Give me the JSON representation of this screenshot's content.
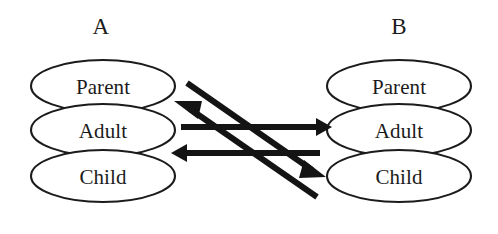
{
  "figure": {
    "background_color": "#ffffff",
    "ink_color": "#1b1b1b",
    "arrow_color": "#141414"
  },
  "columns": [
    {
      "key": "a",
      "label": "A",
      "label_x": 101,
      "label_y": 34,
      "center_x": 103,
      "states": [
        {
          "key": "parent",
          "label": "Parent",
          "cx": 103,
          "cy": 86,
          "rx": 72,
          "ry": 26,
          "text_y": 94
        },
        {
          "key": "adult",
          "label": "Adult",
          "cx": 103,
          "cy": 130,
          "rx": 72,
          "ry": 26,
          "text_y": 138
        },
        {
          "key": "child",
          "label": "Child",
          "cx": 103,
          "cy": 176,
          "rx": 72,
          "ry": 26,
          "text_y": 184
        }
      ]
    },
    {
      "key": "b",
      "label": "B",
      "label_x": 399,
      "label_y": 34,
      "center_x": 399,
      "states": [
        {
          "key": "parent",
          "label": "Parent",
          "cx": 399,
          "cy": 86,
          "rx": 72,
          "ry": 26,
          "text_y": 94
        },
        {
          "key": "adult",
          "label": "Adult",
          "cx": 399,
          "cy": 130,
          "rx": 72,
          "ry": 26,
          "text_y": 138
        },
        {
          "key": "child",
          "label": "Child",
          "cx": 399,
          "cy": 176,
          "rx": 72,
          "ry": 26,
          "text_y": 184
        }
      ]
    }
  ],
  "arrows": [
    {
      "key": "a-adult-to-b-adult",
      "from": "A Adult",
      "to": "B Adult",
      "kind": "horizontal",
      "direction": "right",
      "x1": 181,
      "y1": 127,
      "x2": 316,
      "y2": 127,
      "head": "M316,118 L332,127 L316,136 Z"
    },
    {
      "key": "b-adult-to-a-adult",
      "from": "B Adult",
      "to": "A Adult",
      "kind": "horizontal",
      "direction": "left",
      "x1": 320,
      "y1": 153,
      "x2": 187,
      "y2": 153,
      "head": "M187,144 L171,153 L187,162 Z"
    },
    {
      "key": "b-parent-to-a-child",
      "from": "B Parent",
      "to": "A Child",
      "kind": "diagonal",
      "direction": "down-right",
      "x1": 187,
      "y1": 83,
      "x2": 312,
      "y2": 170,
      "head": "M304,160 L326,177 L299,178 Z"
    },
    {
      "key": "b-child-to-a-parent",
      "from": "B Child",
      "to": "A Parent",
      "kind": "diagonal",
      "direction": "up-left",
      "x1": 317,
      "y1": 197,
      "x2": 190,
      "y2": 109,
      "head": "M198,119 L174,101 L202,101 Z"
    }
  ]
}
